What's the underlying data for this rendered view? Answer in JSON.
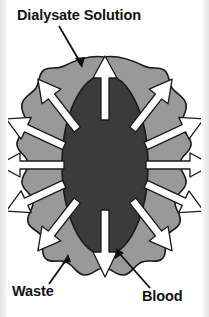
{
  "diagram": {
    "title": "Dialysate Solution",
    "labels": [
      {
        "id": "dialysate",
        "text": "Dialysate Solution",
        "position": "top-left",
        "points_to": "outer-gray-region"
      },
      {
        "id": "waste",
        "text": "Waste",
        "position": "bottom-left",
        "points_to": "white-arrow"
      },
      {
        "id": "blood",
        "text": "Blood",
        "position": "bottom-right",
        "points_to": "inner-dark-region"
      }
    ],
    "regions": [
      {
        "id": "outer-blob",
        "name": "Dialysate Solution",
        "color": "#999999",
        "stroke": "#1a1a1a",
        "description": "irregular gray blob surrounding the blood compartment"
      },
      {
        "id": "inner-ellipse",
        "name": "Blood",
        "color": "#3b3b3b",
        "stroke": "#1a1a1a",
        "description": "dark vertical ellipse representing blood inside the membrane"
      }
    ],
    "arrows": {
      "count": 12,
      "color": "#ffffff",
      "stroke": "#1a1a1a",
      "direction": "outward",
      "meaning": "Waste diffusing from blood into dialysate solution"
    },
    "colors": {
      "background": "#ffffff",
      "dialysate": "#999999",
      "blood": "#3b3b3b",
      "arrow": "#ffffff",
      "outline": "#1a1a1a",
      "text": "#111111",
      "edge_strip": "#e8e8e8"
    }
  }
}
